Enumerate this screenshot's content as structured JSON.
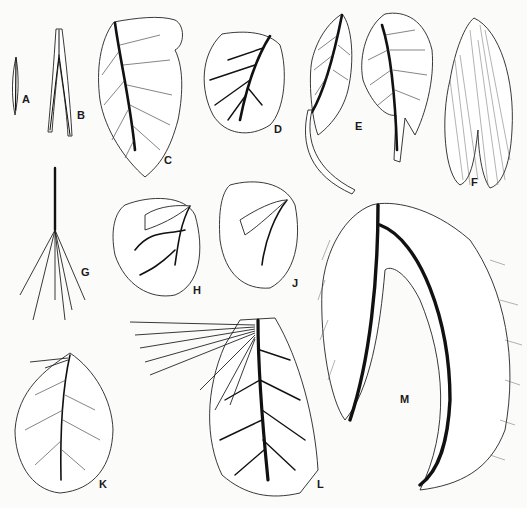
{
  "figure": {
    "panels": [
      {
        "id": "A",
        "label": "A",
        "subject": "small narrow lanceolate leaf"
      },
      {
        "id": "B",
        "label": "B",
        "subject": "forked linear leaf with bristles"
      },
      {
        "id": "C",
        "label": "C",
        "subject": "ovate leaf with pinnate venation"
      },
      {
        "id": "D",
        "label": "D",
        "subject": "rounded leaf with branching veins"
      },
      {
        "id": "E",
        "label": "E",
        "subject": "two leaves with long petiole-like extensions"
      },
      {
        "id": "F",
        "label": "F",
        "subject": "densely striated paired leaves"
      },
      {
        "id": "G",
        "label": "G",
        "subject": "stalk with several filiform branches"
      },
      {
        "id": "H",
        "label": "H",
        "subject": "folded rounded leaf"
      },
      {
        "id": "J",
        "label": "J",
        "subject": "folded oval leaf"
      },
      {
        "id": "K",
        "label": "K",
        "subject": "ovate leaf with small filiform appendages"
      },
      {
        "id": "L",
        "label": "L",
        "subject": "ovate leaf with many filiform appendages"
      },
      {
        "id": "M",
        "label": "M",
        "subject": "large bilobed fringed leaf with heavy midribs"
      }
    ]
  },
  "labels": {
    "A": "A",
    "B": "B",
    "C": "C",
    "D": "D",
    "E": "E",
    "F": "F",
    "G": "G",
    "H": "H",
    "J": "J",
    "K": "K",
    "L": "L",
    "M": "M"
  }
}
